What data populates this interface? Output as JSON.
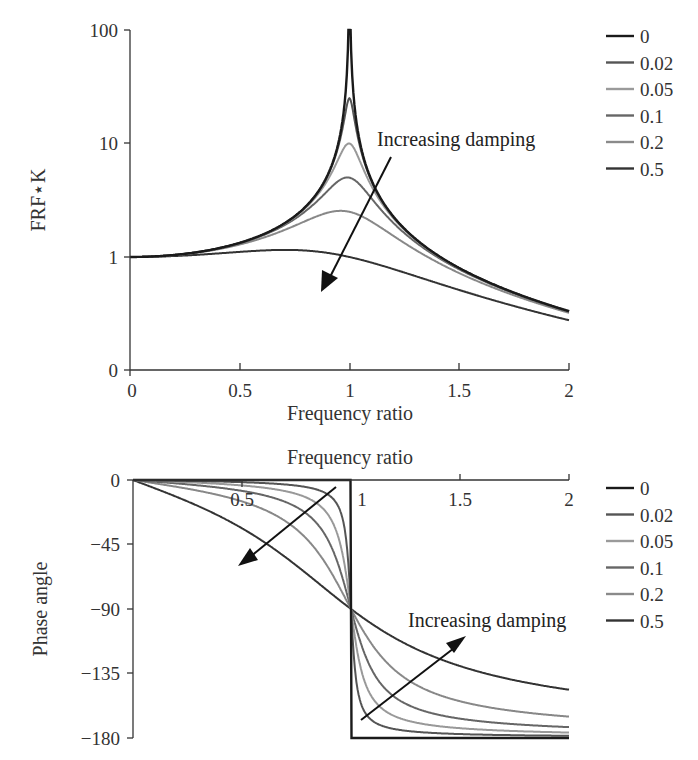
{
  "chart_data": [
    {
      "type": "line",
      "title": "",
      "xlabel": "Frequency ratio",
      "ylabel": "FRF*K",
      "yscale": "log",
      "xlim": [
        0,
        2
      ],
      "ylim_ticks": [
        "0",
        "1",
        "10",
        "100"
      ],
      "x_ticks": [
        "0",
        "0.5",
        "1",
        "1.5",
        "2"
      ],
      "y_ticks": [
        "100",
        "10",
        "1",
        "0"
      ],
      "grid": false,
      "legend_position": "right",
      "annotation": "Increasing damping",
      "series": [
        {
          "name": "0",
          "damping": 0,
          "peak": 100,
          "color": "#1a1a1a"
        },
        {
          "name": "0.02",
          "damping": 0.02,
          "peak": 25,
          "color": "#555555"
        },
        {
          "name": "0.05",
          "damping": 0.05,
          "peak": 10,
          "color": "#999999"
        },
        {
          "name": "0.1",
          "damping": 0.1,
          "peak": 5,
          "color": "#666666"
        },
        {
          "name": "0.2",
          "damping": 0.2,
          "peak": 2.5,
          "color": "#888888"
        },
        {
          "name": "0.5",
          "damping": 0.5,
          "peak": 1.15,
          "color": "#333333"
        }
      ],
      "sample_points": {
        "x": [
          0,
          0.5,
          1.0,
          1.5,
          2.0
        ],
        "0.5": [
          1.0,
          1.11,
          1.0,
          0.55,
          0.29
        ],
        "0.2": [
          1.0,
          1.28,
          2.5,
          0.74,
          0.33
        ],
        "0.1": [
          1.0,
          1.32,
          5.0,
          0.79,
          0.33
        ],
        "0.05": [
          1.0,
          1.33,
          10.0,
          0.8,
          0.33
        ],
        "0.02": [
          1.0,
          1.33,
          25.0,
          0.8,
          0.33
        ],
        "0": [
          1.0,
          1.33,
          100.0,
          0.8,
          0.33
        ]
      }
    },
    {
      "type": "line",
      "title": "Frequency ratio",
      "xlabel": "Frequency ratio",
      "ylabel": "Phase angle",
      "xlim": [
        0,
        2
      ],
      "ylim": [
        -180,
        0
      ],
      "x_ticks": [
        "0.5",
        "1",
        "1.5",
        "2"
      ],
      "y_ticks": [
        "0",
        "−45",
        "−90",
        "−135",
        "−180"
      ],
      "grid": false,
      "legend_position": "right",
      "annotation": "Increasing damping",
      "series": [
        {
          "name": "0",
          "damping": 0,
          "color": "#1a1a1a"
        },
        {
          "name": "0.02",
          "damping": 0.02,
          "color": "#555555"
        },
        {
          "name": "0.05",
          "damping": 0.05,
          "color": "#999999"
        },
        {
          "name": "0.1",
          "damping": 0.1,
          "color": "#666666"
        },
        {
          "name": "0.2",
          "damping": 0.2,
          "color": "#888888"
        },
        {
          "name": "0.5",
          "damping": 0.5,
          "color": "#333333"
        }
      ],
      "sample_points": {
        "x": [
          0,
          0.5,
          1.0,
          1.5,
          2.0
        ],
        "0.5": [
          0,
          -33.7,
          -90,
          -129.8,
          -146.3
        ],
        "0.2": [
          0,
          -14.9,
          -90,
          -154.4,
          -165.1
        ],
        "0.1": [
          0,
          -7.6,
          -90,
          -166.9,
          -172.4
        ],
        "0.05": [
          0,
          -3.8,
          -90,
          -173.2,
          -176.2
        ],
        "0.02": [
          0,
          -1.5,
          -90,
          -177.3,
          -178.5
        ],
        "0": [
          0,
          0,
          -90,
          -180,
          -180
        ]
      }
    }
  ],
  "top_chart": {
    "ylabel": "FRF⋆K",
    "xlabel": "Frequency ratio",
    "y_ticks": [
      "100",
      "10",
      "1",
      "0"
    ],
    "x_ticks": [
      "0",
      "0.5",
      "1",
      "1.5",
      "2"
    ],
    "annotation": "Increasing damping"
  },
  "bottom_chart": {
    "ylabel": "Phase angle",
    "xlabel": "Frequency ratio",
    "y_ticks": [
      "0",
      "−45",
      "−90",
      "−135",
      "−180"
    ],
    "x_ticks": [
      "0.5",
      "1",
      "1.5",
      "2"
    ],
    "annotation": "Increasing damping"
  },
  "legend": {
    "items": [
      {
        "label": "0",
        "color": "#1a1a1a"
      },
      {
        "label": "0.02",
        "color": "#555555"
      },
      {
        "label": "0.05",
        "color": "#9a9a9a"
      },
      {
        "label": "0.1",
        "color": "#666666"
      },
      {
        "label": "0.2",
        "color": "#8a8a8a"
      },
      {
        "label": "0.5",
        "color": "#333333"
      }
    ]
  }
}
